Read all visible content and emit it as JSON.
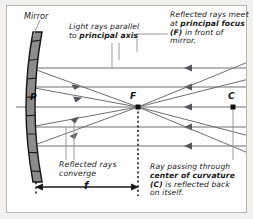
{
  "diagram": {
    "background_color": "#f2f1ef",
    "panel_color": "#ffffff",
    "ray_color": "#6f6f73",
    "mirror_fill": "#8c8c8c",
    "text_color": "#1a1a1a"
  },
  "labels": {
    "mirror": "Mirror",
    "parallel_line1": "Light rays parallel",
    "parallel_line2_pre": "to ",
    "parallel_line2_bold": "principal axis",
    "focus_line1": "Reflected rays meet",
    "focus_line2_pre": "at ",
    "focus_line2_bold": "principal focus",
    "focus_line3_bold": "(F)",
    "focus_line3_post": " in front of mirror.",
    "converge_line1": "Reflected rays",
    "converge_line2": "converge",
    "curvature_line1": "Ray passing through",
    "curvature_line2_bold": "center of curvature",
    "curvature_line3_bold": "(C)",
    "curvature_line3_post": " is reflected back",
    "curvature_line4": "on itself."
  },
  "points": {
    "pole": "P",
    "focus": "F",
    "center": "C"
  },
  "measures": {
    "focal_length": "f"
  },
  "geometry": {
    "focus_x": 138,
    "focus_y": 107,
    "center_x": 233,
    "center_y": 107,
    "pole_x": 36,
    "axis_y": 107,
    "parallel_ray_y": [
      68,
      87,
      107,
      127,
      146
    ],
    "mirror_top_y": 32,
    "mirror_bottom_y": 182
  }
}
